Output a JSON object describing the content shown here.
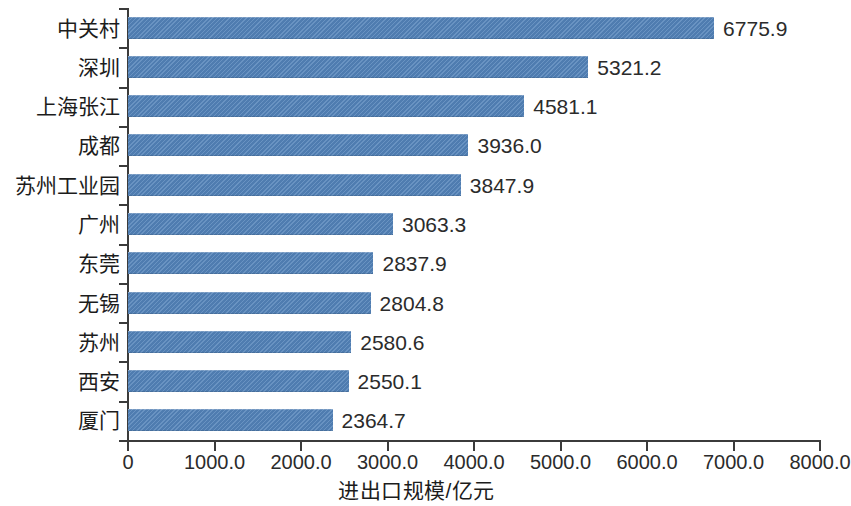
{
  "chart_data": {
    "type": "bar",
    "orientation": "horizontal",
    "title": "",
    "xlabel": "进出口规模/亿元",
    "ylabel": "",
    "xlim": [
      0,
      8000
    ],
    "grid": false,
    "legend": null,
    "categories": [
      "中关村",
      "深圳",
      "上海张江",
      "成都",
      "苏州工业园",
      "广州",
      "东莞",
      "无锡",
      "苏州",
      "西安",
      "厦门"
    ],
    "values": [
      6775.9,
      5321.2,
      4581.1,
      3936.0,
      3847.9,
      3063.3,
      2837.9,
      2804.8,
      2580.6,
      2550.1,
      2364.7
    ],
    "value_labels": [
      "6775.9",
      "5321.2",
      "4581.1",
      "3936.0",
      "3847.9",
      "3063.3",
      "2837.9",
      "2804.8",
      "2580.6",
      "2550.1",
      "2364.7"
    ],
    "xticks": [
      0,
      1000,
      2000,
      3000,
      4000,
      5000,
      6000,
      7000,
      8000
    ],
    "xtick_labels": [
      "0",
      "1000.0",
      "2000.0",
      "3000.0",
      "4000.0",
      "5000.0",
      "6000.0",
      "7000.0",
      "8000.0"
    ],
    "bar_color": "#5383b9",
    "axis_color": "#3b3b3b",
    "text_color": "#1c1c1c",
    "background_color": "#ffffff"
  }
}
